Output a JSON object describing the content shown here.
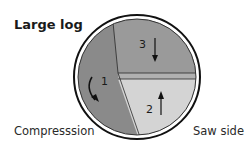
{
  "title": "Large log",
  "labels": {
    "left": "Compresssion",
    "right": "Saw side"
  },
  "sections": [
    {
      "number": "1",
      "arrow": "curved-down",
      "color": "#8a8a8a"
    },
    {
      "number": "2",
      "arrow": "up",
      "color": "#d4d4d4"
    },
    {
      "number": "3",
      "arrow": "down",
      "color": "#9a9a9a"
    }
  ],
  "colors": {
    "outline": "#111111",
    "band": "#b0b0b0",
    "background": "#ffffff"
  }
}
